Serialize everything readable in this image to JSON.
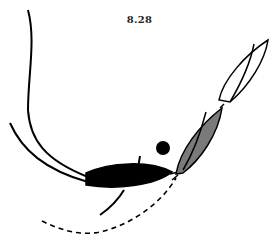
{
  "figure": {
    "label": "8.28",
    "elements": [
      {
        "id": "course-line-1",
        "type": "solid-curve",
        "description": "long curved track from top-left descending to black boat"
      },
      {
        "id": "course-line-2",
        "type": "solid-curve",
        "description": "second curved track from left joining black boat"
      },
      {
        "id": "black-boat",
        "type": "boat",
        "fill": "#000000"
      },
      {
        "id": "hatched-boat",
        "type": "boat",
        "fill": "#7a7a7a"
      },
      {
        "id": "white-boat",
        "type": "boat",
        "fill": "#ffffff"
      },
      {
        "id": "mark",
        "type": "circle",
        "fill": "#000000"
      },
      {
        "id": "dashed-track",
        "type": "dashed-curve"
      },
      {
        "id": "lower-track",
        "type": "solid-curve"
      }
    ],
    "colors": {
      "ink": "#000000",
      "hatched": "#7a7a7a",
      "background": "#ffffff"
    }
  }
}
